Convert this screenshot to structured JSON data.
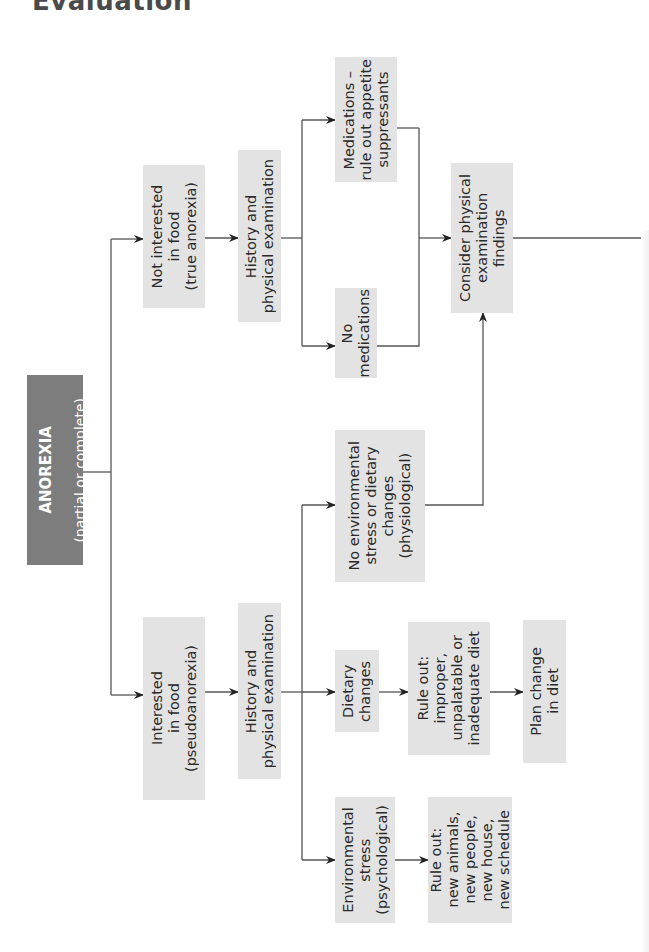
{
  "title": "Evaluation",
  "colors": {
    "box_fill": "#e3e3e3",
    "root_fill": "#7d7d7d",
    "line": "#555555",
    "text": "#2a2a2a"
  },
  "nodes": {
    "root": {
      "title": "ANOREXIA",
      "subtitle": "(partial or complete)"
    },
    "interested": {
      "label": "Interested\nin food\n(pseudoanorexia)"
    },
    "not_interested": {
      "label": "Not interested\nin food\n(true anorexia)"
    },
    "history_left": {
      "label": "History and\nphysical examination"
    },
    "history_right": {
      "label": "History and\nphysical examination"
    },
    "env_stress": {
      "label": "Environmental\nstress\n(psychological)"
    },
    "rule_out_env": {
      "label": "Rule out:\nnew animals,\nnew people,\nnew house,\nnew schedule"
    },
    "dietary_changes": {
      "label": "Dietary\nchanges"
    },
    "rule_out_diet": {
      "label": "Rule out:\nimproper,\nunpalatable or\ninadequate diet"
    },
    "plan_change": {
      "label": "Plan change\nin diet"
    },
    "no_env_stress": {
      "label": "No environmental\nstress or dietary\nchanges\n(physiological)"
    },
    "no_medications": {
      "label": "No\nmedications"
    },
    "medications": {
      "label": "Medications –\nrule out appetite\nsuppressants"
    },
    "consider_exam": {
      "label": "Consider physical\nexamination\nfindings"
    }
  },
  "edges": [
    [
      "root",
      "interested"
    ],
    [
      "root",
      "not_interested"
    ],
    [
      "interested",
      "history_left"
    ],
    [
      "not_interested",
      "history_right"
    ],
    [
      "history_left",
      "env_stress"
    ],
    [
      "history_left",
      "dietary_changes"
    ],
    [
      "history_left",
      "no_env_stress"
    ],
    [
      "env_stress",
      "rule_out_env"
    ],
    [
      "dietary_changes",
      "rule_out_diet"
    ],
    [
      "rule_out_diet",
      "plan_change"
    ],
    [
      "no_env_stress",
      "consider_exam"
    ],
    [
      "history_right",
      "no_medications"
    ],
    [
      "history_right",
      "medications"
    ],
    [
      "no_medications",
      "consider_exam"
    ],
    [
      "medications",
      "consider_exam"
    ],
    [
      "consider_exam",
      "offscreen-right"
    ]
  ]
}
